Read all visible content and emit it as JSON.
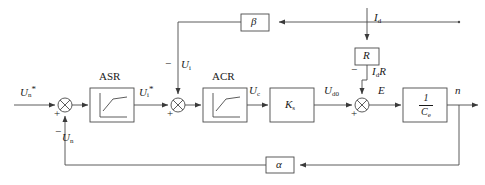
{
  "diagram": {
    "type": "control-block-diagram",
    "colors": {
      "line": "#4a4a4a",
      "text": "#1a1a1a",
      "background": "#ffffff"
    },
    "blocks": [
      {
        "id": "asr",
        "label": "ASR",
        "caption": "ASR",
        "icon": "saturation-curve",
        "x": 90,
        "y": 88,
        "w": 44,
        "h": 34
      },
      {
        "id": "acr",
        "label": "ACR",
        "caption": "ACR",
        "icon": "saturation-curve",
        "x": 203,
        "y": 88,
        "w": 44,
        "h": 34
      },
      {
        "id": "ks",
        "label": "Ks",
        "caption": "",
        "icon": "text",
        "x": 270,
        "y": 88,
        "w": 44,
        "h": 34
      },
      {
        "id": "ce",
        "label": "1/Ce",
        "caption": "",
        "icon": "fraction",
        "x": 403,
        "y": 88,
        "w": 44,
        "h": 34
      },
      {
        "id": "beta",
        "label": "β",
        "caption": "",
        "icon": "text",
        "x": 241,
        "y": 14,
        "w": 28,
        "h": 17
      },
      {
        "id": "r",
        "label": "R",
        "caption": "",
        "icon": "text",
        "x": 355,
        "y": 48,
        "w": 24,
        "h": 17
      },
      {
        "id": "alpha",
        "label": "α",
        "caption": "",
        "icon": "text",
        "x": 266,
        "y": 157,
        "w": 28,
        "h": 16
      }
    ],
    "block_text": {
      "asr_caption": "ASR",
      "acr_caption": "ACR",
      "ks_label": "K",
      "ks_sub": "s",
      "ce_numerator": "1",
      "ce_denominator": "C",
      "ce_denominator_sub": "e",
      "beta_label": "β",
      "r_label": "R",
      "alpha_label": "α"
    },
    "summers": [
      {
        "id": "sum1",
        "cx": 65,
        "cy": 105,
        "r": 7,
        "inputs": [
          {
            "sign": "+",
            "side": "left"
          },
          {
            "sign": "−",
            "side": "bottom"
          }
        ]
      },
      {
        "id": "sum2",
        "cx": 178,
        "cy": 105,
        "r": 7,
        "inputs": [
          {
            "sign": "+",
            "side": "left"
          },
          {
            "sign": "−",
            "side": "top"
          }
        ]
      },
      {
        "id": "sum3",
        "cx": 362,
        "cy": 105,
        "r": 7,
        "inputs": [
          {
            "sign": "+",
            "side": "left"
          },
          {
            "sign": "−",
            "side": "top"
          }
        ]
      }
    ],
    "signals": [
      {
        "id": "un-ref",
        "text": "Un*",
        "base": "U",
        "sub": "n",
        "star": true,
        "x": 20,
        "y": 88,
        "desc": "speed reference input"
      },
      {
        "id": "ui-ref",
        "text": "Ui*",
        "base": "U",
        "sub": "i",
        "star": true,
        "x": 139,
        "y": 88,
        "desc": "current reference"
      },
      {
        "id": "ui-fb",
        "text": "Ui",
        "base": "U",
        "sub": "i",
        "star": false,
        "x": 181,
        "y": 62,
        "desc": "current feedback voltage"
      },
      {
        "id": "uc",
        "text": "Uc",
        "base": "U",
        "sub": "c",
        "star": false,
        "x": 249,
        "y": 88,
        "desc": "control voltage"
      },
      {
        "id": "ud0",
        "text": "Ud0",
        "base": "U",
        "sub": "d0",
        "star": false,
        "x": 327,
        "y": 88,
        "desc": "ideal no-load EMF"
      },
      {
        "id": "e",
        "text": "E",
        "base": "E",
        "sub": "",
        "star": false,
        "x": 379,
        "y": 88,
        "desc": "back EMF"
      },
      {
        "id": "n",
        "text": "n",
        "base": "n",
        "sub": "",
        "star": false,
        "x": 455,
        "y": 88,
        "desc": "speed output"
      },
      {
        "id": "un-fb",
        "text": "Un",
        "base": "U",
        "sub": "n",
        "star": false,
        "x": 38,
        "y": 136,
        "desc": "speed feedback voltage"
      },
      {
        "id": "id",
        "text": "Id",
        "base": "I",
        "sub": "d",
        "star": false,
        "x": 384,
        "y": 14,
        "desc": "armature current"
      },
      {
        "id": "idr",
        "text": "IdR",
        "base": "I",
        "sub": "d",
        "star": false,
        "x": 370,
        "y": 68,
        "desc": "armature resistance drop"
      }
    ],
    "signs": [
      {
        "id": "sum1-plus",
        "text": "+",
        "x": 54,
        "y": 110
      },
      {
        "id": "sum1-minus",
        "text": "−",
        "x": 55,
        "y": 130
      },
      {
        "id": "sum2-plus",
        "text": "+",
        "x": 167,
        "y": 110
      },
      {
        "id": "sum2-minus",
        "text": "−",
        "x": 166,
        "y": 62
      },
      {
        "id": "sum3-plus",
        "text": "+",
        "x": 351,
        "y": 110
      },
      {
        "id": "sum3-minus",
        "text": "−",
        "x": 352,
        "y": 68
      }
    ],
    "paths": {
      "forward": "Un* → ⊗ → ASR → ⊗ → ACR → Ks → ⊗ → 1/Ce → n",
      "current_feedback": "Id → β → second summer (negative)",
      "speed_feedback": "n → α → first summer (negative)",
      "disturbance": "Id → R → IdR → third summer (negative)"
    }
  }
}
